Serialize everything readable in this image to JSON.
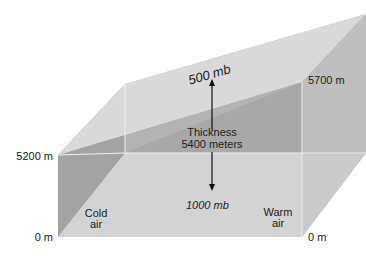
{
  "diagram": {
    "type": "3d-block-thickness-diagram",
    "colors": {
      "top_surface": "#d7d7d7",
      "front_top_sheet": "#a9a9a9",
      "left_side_dark": "#9e9e9e",
      "right_side": "#bdbdbd",
      "floor": "#d2d2d2",
      "edge_light": "#f2f2f2",
      "arrow": "#111111",
      "text": "#222222"
    },
    "labels": {
      "upper_surface": "500 mb",
      "lower_surface": "1000 mb",
      "thickness_line1": "Thickness",
      "thickness_line2": "5400 meters",
      "left_top_height": "5200 m",
      "left_bottom_height": "0 m",
      "right_top_height": "5700 m",
      "right_bottom_height": "0 m",
      "cold_line1": "Cold",
      "cold_line2": "air",
      "warm_line1": "Warm",
      "warm_line2": "air"
    }
  }
}
